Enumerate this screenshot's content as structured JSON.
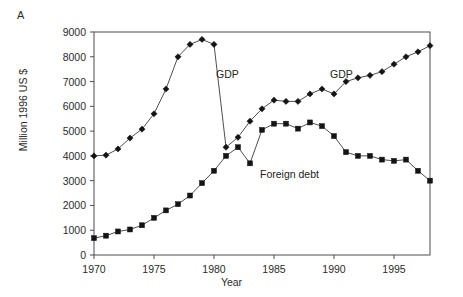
{
  "figure": {
    "panel_letter": "A",
    "ylabel": "Million 1996 US $",
    "xlabel": "Year"
  },
  "annotations": {
    "gdp_left": "GDP",
    "gdp_right": "GDP",
    "foreign_debt": "Foreign debt"
  },
  "axes": {
    "y_ticks": [
      "0",
      "1000",
      "2000",
      "3000",
      "4000",
      "5000",
      "6000",
      "7000",
      "8000",
      "9000"
    ],
    "x_ticks": [
      "1970",
      "1975",
      "1980",
      "1985",
      "1990",
      "1995"
    ]
  },
  "chart_data": {
    "type": "line",
    "title": "",
    "subtitle": "",
    "panel": "A",
    "xlabel": "Year",
    "ylabel": "Million 1996 US $",
    "xlim": [
      1970,
      1998
    ],
    "ylim": [
      0,
      9000
    ],
    "ytick_values": [
      0,
      1000,
      2000,
      3000,
      4000,
      5000,
      6000,
      7000,
      8000,
      9000
    ],
    "xtick_values": [
      1970,
      1975,
      1980,
      1985,
      1990,
      1995
    ],
    "grid": false,
    "legend": "inline-annotations",
    "marker_styles": {
      "GDP": "diamond",
      "Foreign debt": "square"
    },
    "x": [
      1970,
      1971,
      1972,
      1973,
      1974,
      1975,
      1976,
      1977,
      1978,
      1979,
      1980,
      1981,
      1982,
      1983,
      1984,
      1985,
      1986,
      1987,
      1988,
      1989,
      1990,
      1991,
      1992,
      1993,
      1994,
      1995,
      1996,
      1997,
      1998
    ],
    "series": [
      {
        "name": "GDP",
        "marker": "diamond",
        "values": [
          4000,
          4030,
          4280,
          4720,
          5080,
          5700,
          6700,
          8000,
          8500,
          8700,
          8500,
          4350,
          4750,
          5400,
          5900,
          6250,
          6200,
          6200,
          6500,
          6700,
          6500,
          7000,
          7150,
          7250,
          7400,
          7700,
          8000,
          8200,
          8450
        ]
      },
      {
        "name": "Foreign debt",
        "marker": "square",
        "values": [
          680,
          780,
          950,
          1030,
          1200,
          1500,
          1800,
          2050,
          2400,
          2900,
          3400,
          4000,
          4350,
          3700,
          5050,
          5300,
          5300,
          5100,
          5350,
          5200,
          4800,
          4150,
          4000,
          4000,
          3850,
          3800,
          3850,
          3400,
          3000
        ]
      }
    ]
  }
}
